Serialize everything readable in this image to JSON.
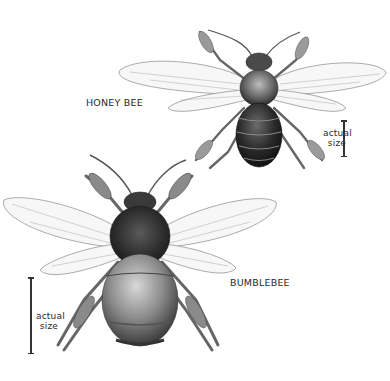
{
  "illustration": {
    "style": "graphite pencil natural-history drawing",
    "background": "#ffffff",
    "ink_color": "#2a2a2a"
  },
  "honey_bee": {
    "label": "HONEY BEE",
    "scale": {
      "line1": "actual",
      "line2": "size"
    }
  },
  "bumblebee": {
    "label": "BUMBLEBEE",
    "scale": {
      "line1": "actual",
      "line2": "size"
    }
  }
}
